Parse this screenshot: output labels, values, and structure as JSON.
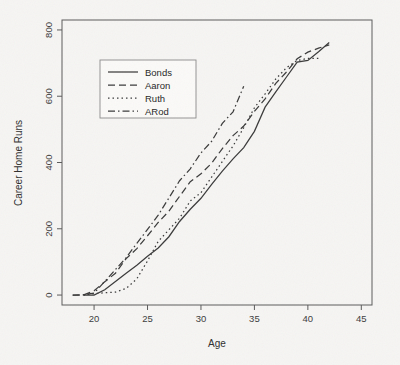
{
  "chart_data": {
    "type": "line",
    "title": "",
    "xlabel": "Age",
    "ylabel": "Career Home Runs",
    "xlim": [
      17,
      46
    ],
    "ylim": [
      -30,
      830
    ],
    "xticks": [
      20,
      25,
      30,
      35,
      40,
      45
    ],
    "yticks": [
      0,
      200,
      400,
      600,
      800
    ],
    "grid": false,
    "legend_position": "top-left-inside",
    "series": [
      {
        "name": "Bonds",
        "dash": "solid",
        "x": [
          19,
          20,
          21,
          22,
          23,
          24,
          25,
          26,
          27,
          28,
          29,
          30,
          31,
          32,
          33,
          34,
          35,
          36,
          37,
          38,
          39,
          40,
          41,
          42
        ],
        "y": [
          0,
          0,
          16,
          41,
          66,
          90,
          117,
          142,
          176,
          222,
          259,
          292,
          334,
          374,
          411,
          445,
          494,
          567,
          613,
          658,
          703,
          708,
          734,
          762
        ]
      },
      {
        "name": "Aaron",
        "dash": "dashed",
        "x": [
          18,
          19,
          20,
          21,
          22,
          23,
          24,
          25,
          26,
          27,
          28,
          29,
          30,
          31,
          32,
          33,
          34,
          35,
          36,
          37,
          38,
          39,
          40,
          41,
          42
        ],
        "y": [
          0,
          0,
          13,
          40,
          66,
          110,
          140,
          179,
          219,
          253,
          298,
          342,
          366,
          398,
          442,
          481,
          510,
          554,
          592,
          639,
          673,
          713,
          733,
          745,
          755
        ]
      },
      {
        "name": "Ruth",
        "dash": "dotted",
        "x": [
          19,
          20,
          21,
          22,
          23,
          24,
          25,
          26,
          27,
          28,
          29,
          30,
          31,
          32,
          33,
          34,
          35,
          36,
          37,
          38,
          39,
          40,
          41
        ],
        "y": [
          0,
          4,
          7,
          9,
          20,
          49,
          103,
          162,
          197,
          232,
          284,
          309,
          356,
          403,
          450,
          505,
          565,
          607,
          652,
          686,
          708,
          714,
          714
        ]
      },
      {
        "name": "ARod",
        "dash": "dashdot",
        "x": [
          18,
          19,
          20,
          21,
          22,
          23,
          24,
          25,
          26,
          27,
          28,
          29,
          30,
          31,
          32,
          33,
          34
        ],
        "y": [
          0,
          1,
          6,
          41,
          77,
          113,
          156,
          198,
          241,
          293,
          345,
          381,
          429,
          464,
          518,
          553,
          630
        ]
      }
    ]
  },
  "legend": {
    "entries": [
      {
        "label": "Bonds",
        "dash": "solid"
      },
      {
        "label": "Aaron",
        "dash": "dashed"
      },
      {
        "label": "Ruth",
        "dash": "dotted"
      },
      {
        "label": "ARod",
        "dash": "dashdot"
      }
    ]
  },
  "colors": {
    "background": "#f6f5f3",
    "ink": "#3a3a3a",
    "axis": "#5a5a5a",
    "legend_fill": "#fbfaf8"
  }
}
